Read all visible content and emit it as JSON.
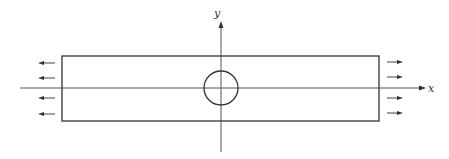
{
  "diagram": {
    "axes": {
      "x_label": "x",
      "y_label": "y"
    },
    "loads": {
      "left": {
        "direction": "left",
        "count": 4
      },
      "right": {
        "direction": "right",
        "count": 4
      }
    },
    "hole": {
      "shape": "circle",
      "position": "center"
    },
    "colors": {
      "line": "#333333",
      "axis": "#555555",
      "background": "#ffffff"
    }
  }
}
